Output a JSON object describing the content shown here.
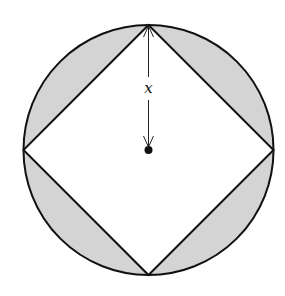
{
  "diagram": {
    "circle": {
      "cx": 148.5,
      "cy": 150,
      "r": 125
    },
    "square_vertices": [
      {
        "name": "top",
        "x": 148.5,
        "y": 25
      },
      {
        "name": "right",
        "x": 273.5,
        "y": 150
      },
      {
        "name": "bottom",
        "x": 148.5,
        "y": 275
      },
      {
        "name": "left",
        "x": 23.5,
        "y": 150
      }
    ],
    "center_point": {
      "x": 148.5,
      "y": 150
    },
    "radius_label": "x",
    "colors": {
      "shaded_region": "#d4d4d4",
      "stroke": "#111111",
      "background": "#ffffff"
    }
  }
}
